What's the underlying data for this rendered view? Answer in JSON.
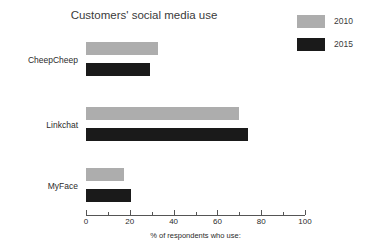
{
  "chart_data": {
    "type": "bar",
    "orientation": "horizontal",
    "title": "Customers' social media use",
    "xlabel": "% of respondents who use:",
    "ylabel": "",
    "categories": [
      "CheepCheep",
      "Linkchat",
      "MyFace"
    ],
    "series": [
      {
        "name": "2010",
        "color": "#adadad",
        "values": [
          33,
          70,
          17.5
        ]
      },
      {
        "name": "2015",
        "color": "#1a1a1a",
        "values": [
          29,
          74,
          20.5
        ]
      }
    ],
    "xlim": [
      0,
      100
    ],
    "xticks": [
      0,
      20,
      40,
      60,
      80,
      100
    ],
    "xtick_labels": [
      "0",
      "20",
      "40",
      "60",
      "80",
      "100"
    ],
    "minor_xticks": [
      10,
      30,
      50,
      70,
      90
    ],
    "grid": false,
    "legend_position": "top-right"
  },
  "legend": {
    "entries": [
      {
        "label": "2010",
        "color": "#adadad"
      },
      {
        "label": "2015",
        "color": "#1a1a1a"
      }
    ]
  },
  "axis": {
    "labels": [
      "0",
      "20",
      "40",
      "60",
      "80",
      "100"
    ],
    "xlabel": "% of respondents who use:"
  },
  "categories": {
    "items": [
      "CheepCheep",
      "Linkchat",
      "MyFace"
    ]
  }
}
